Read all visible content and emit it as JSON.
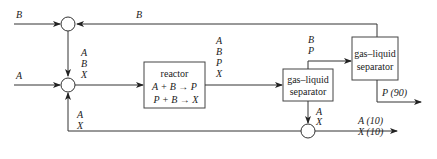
{
  "diagram": {
    "type": "process-flow",
    "units": {
      "reactor": {
        "title": "reactor",
        "reaction1": "A + B → P",
        "reaction2": "P + B → X"
      },
      "separator1": {
        "line1": "gas–liquid",
        "line2": "separator"
      },
      "separator2": {
        "line1": "gas–liquid",
        "line2": "separator"
      }
    },
    "streams": {
      "feed_b": "B",
      "recycle_b": "B",
      "feed_a": "A",
      "mixer_out": [
        "A",
        "B",
        "X"
      ],
      "recycle_ax": [
        "A",
        "X"
      ],
      "reactor_out": [
        "A",
        "B",
        "P",
        "X"
      ],
      "sep1_gas": [
        "B",
        "P"
      ],
      "sep1_liquid": [
        "A",
        "X"
      ],
      "product": "P (90)",
      "purge": [
        "A (10)",
        "X (10)"
      ]
    }
  }
}
